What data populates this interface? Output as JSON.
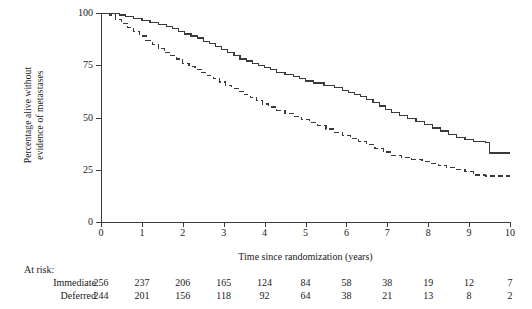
{
  "chart_data": {
    "type": "line",
    "title": "",
    "xlabel": "Time since randomization (years)",
    "ylabel": "Percentage alive without\nevidence of metastases",
    "xlim": [
      0,
      10
    ],
    "ylim": [
      0,
      100
    ],
    "xticks": [
      0,
      1,
      2,
      3,
      4,
      5,
      6,
      7,
      8,
      9,
      10
    ],
    "yticks": [
      0,
      25,
      50,
      75,
      100
    ],
    "grid": false,
    "legend_position": "none",
    "step_plot": true,
    "series": [
      {
        "name": "Immediate",
        "style": "solid",
        "color": "#3a3a3a",
        "points": [
          [
            0.0,
            100
          ],
          [
            0.35,
            100
          ],
          [
            0.45,
            99
          ],
          [
            0.6,
            98.5
          ],
          [
            0.8,
            97.5
          ],
          [
            1.0,
            96.5
          ],
          [
            1.2,
            95.5
          ],
          [
            1.4,
            94.5
          ],
          [
            1.6,
            93.5
          ],
          [
            1.75,
            92.5
          ],
          [
            1.9,
            91
          ],
          [
            2.05,
            90
          ],
          [
            2.2,
            89
          ],
          [
            2.35,
            88
          ],
          [
            2.5,
            86.5
          ],
          [
            2.65,
            85.5
          ],
          [
            2.8,
            84
          ],
          [
            2.95,
            82.5
          ],
          [
            3.1,
            81
          ],
          [
            3.25,
            79.5
          ],
          [
            3.4,
            78
          ],
          [
            3.55,
            77
          ],
          [
            3.7,
            76
          ],
          [
            3.85,
            75
          ],
          [
            4.0,
            74
          ],
          [
            4.15,
            73
          ],
          [
            4.3,
            71.5
          ],
          [
            4.5,
            70.5
          ],
          [
            4.7,
            69.5
          ],
          [
            4.85,
            68.5
          ],
          [
            5.0,
            67.5
          ],
          [
            5.2,
            66.5
          ],
          [
            5.45,
            65.5
          ],
          [
            5.7,
            64.5
          ],
          [
            5.9,
            63
          ],
          [
            6.05,
            62
          ],
          [
            6.2,
            61
          ],
          [
            6.35,
            60
          ],
          [
            6.5,
            58.5
          ],
          [
            6.65,
            57
          ],
          [
            6.8,
            55.5
          ],
          [
            6.95,
            54
          ],
          [
            7.1,
            52.5
          ],
          [
            7.3,
            51
          ],
          [
            7.5,
            49.5
          ],
          [
            7.7,
            48
          ],
          [
            7.9,
            46.5
          ],
          [
            8.1,
            45
          ],
          [
            8.3,
            43.5
          ],
          [
            8.5,
            42
          ],
          [
            8.7,
            40.5
          ],
          [
            8.9,
            39.5
          ],
          [
            9.1,
            38.5
          ],
          [
            9.4,
            38
          ],
          [
            9.5,
            33
          ],
          [
            10.0,
            33
          ]
        ]
      },
      {
        "name": "Deferred",
        "style": "dashed",
        "color": "#3a3a3a",
        "points": [
          [
            0.0,
            100
          ],
          [
            0.2,
            99
          ],
          [
            0.35,
            97
          ],
          [
            0.5,
            95
          ],
          [
            0.65,
            93
          ],
          [
            0.8,
            91
          ],
          [
            0.95,
            89
          ],
          [
            1.1,
            87
          ],
          [
            1.25,
            85
          ],
          [
            1.4,
            83
          ],
          [
            1.55,
            81
          ],
          [
            1.7,
            79.5
          ],
          [
            1.85,
            78
          ],
          [
            2.0,
            76
          ],
          [
            2.15,
            74.5
          ],
          [
            2.3,
            73
          ],
          [
            2.45,
            71.5
          ],
          [
            2.6,
            70
          ],
          [
            2.75,
            68.5
          ],
          [
            2.9,
            67
          ],
          [
            3.05,
            65.5
          ],
          [
            3.2,
            64
          ],
          [
            3.35,
            62.5
          ],
          [
            3.5,
            61
          ],
          [
            3.65,
            59.5
          ],
          [
            3.8,
            58
          ],
          [
            3.95,
            56.5
          ],
          [
            4.1,
            55
          ],
          [
            4.3,
            53.5
          ],
          [
            4.5,
            52
          ],
          [
            4.7,
            50.5
          ],
          [
            4.9,
            49
          ],
          [
            5.1,
            47.5
          ],
          [
            5.3,
            46
          ],
          [
            5.5,
            44.5
          ],
          [
            5.7,
            43
          ],
          [
            5.9,
            41.5
          ],
          [
            6.1,
            40
          ],
          [
            6.3,
            38.5
          ],
          [
            6.5,
            37
          ],
          [
            6.7,
            35
          ],
          [
            6.9,
            33.5
          ],
          [
            7.1,
            32
          ],
          [
            7.35,
            31
          ],
          [
            7.6,
            30
          ],
          [
            7.85,
            29
          ],
          [
            8.05,
            28
          ],
          [
            8.25,
            27
          ],
          [
            8.45,
            26
          ],
          [
            8.7,
            25
          ],
          [
            8.9,
            24
          ],
          [
            9.1,
            22.5
          ],
          [
            9.4,
            22
          ],
          [
            10.0,
            22
          ]
        ]
      }
    ],
    "at_risk": {
      "title": "At risk:",
      "times": [
        0,
        1,
        2,
        3,
        4,
        5,
        6,
        7,
        8,
        9,
        10
      ],
      "rows": [
        {
          "label": "Immediate",
          "counts": [
            256,
            237,
            206,
            165,
            124,
            84,
            58,
            38,
            19,
            12,
            7
          ]
        },
        {
          "label": "Deferred",
          "counts": [
            244,
            201,
            156,
            118,
            92,
            64,
            38,
            21,
            13,
            8,
            2
          ]
        }
      ]
    }
  }
}
